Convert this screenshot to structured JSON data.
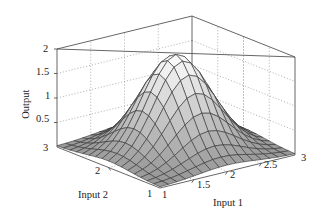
{
  "chart_data": {
    "type": "surface",
    "title": "",
    "xlabel": "Input 1",
    "ylabel": "Input 2",
    "zlabel": "Output",
    "xlim": [
      1,
      3
    ],
    "ylim": [
      1,
      3
    ],
    "zlim": [
      0,
      2
    ],
    "x_ticks": [
      "1",
      "1.5",
      "2",
      "2.5",
      "3"
    ],
    "y_ticks": [
      "1",
      "2",
      "3"
    ],
    "z_ticks": [
      "0.5",
      "1",
      "1.5",
      "2"
    ],
    "grid": true,
    "surface_description": "Gaussian-like bell surface peaking near (2, 2) at about 1.95, falling to near 0 at the edges; grid 17x17 mesh",
    "peak": {
      "x": 2,
      "y": 2,
      "z": 1.95
    },
    "mesh_resolution": 17
  },
  "labels": {
    "z_axis": "Output",
    "x_axis": "Input 1",
    "y_axis": "Input 2"
  }
}
